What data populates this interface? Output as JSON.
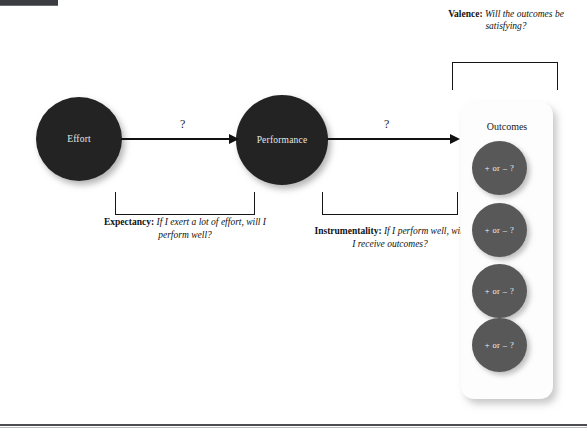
{
  "figure": {
    "background_color": "#ffffff",
    "node_color": "#232323",
    "outcome_color": "#585859",
    "line_color": "#111111"
  },
  "nodes": [
    {
      "id": "effort",
      "label": "Effort"
    },
    {
      "id": "performance",
      "label": "Performance"
    }
  ],
  "arrows": [
    {
      "id": "effort-to-performance",
      "label": "?"
    },
    {
      "id": "performance-to-outcomes",
      "label": "?"
    }
  ],
  "captions": {
    "expectancy": {
      "term": "Expectancy:",
      "text": "If I exert a lot of effort, will I perform well?"
    },
    "instrumentality": {
      "term": "Instrumentality:",
      "text": "If I perform well, will I receive outcomes?"
    },
    "valence": {
      "term": "Valence:",
      "text": "Will the outcomes be satisfying?"
    }
  },
  "outcomes": {
    "label": "Outcomes",
    "items": [
      {
        "label": "+ or – ?"
      },
      {
        "label": "+ or – ?"
      },
      {
        "label": "+ or – ?"
      },
      {
        "label": "+ or – ?"
      }
    ]
  }
}
